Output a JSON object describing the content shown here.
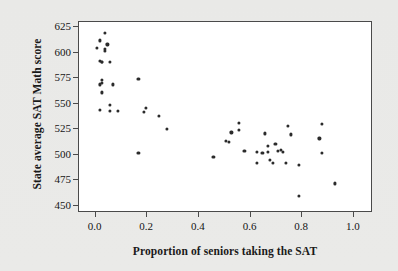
{
  "figure": {
    "background_color": "#e9e9e7",
    "plot_background_color": "#ffffff",
    "frame_color": "#4a4a4a",
    "point_color": "#2b2b2b"
  },
  "chart_data": {
    "type": "scatter",
    "title": "",
    "xlabel": "Proportion of seniors taking the SAT",
    "ylabel": "State average SAT Math score",
    "xlim": [
      -0.06,
      1.07
    ],
    "ylim": [
      444,
      629
    ],
    "grid": false,
    "legend": null,
    "xticks": [
      0.0,
      0.2,
      0.4,
      0.6,
      0.8,
      1.0
    ],
    "xtick_labels": [
      "0.0",
      "0.2",
      "0.4",
      "0.6",
      "0.8",
      "1.0"
    ],
    "yticks": [
      450,
      475,
      500,
      525,
      550,
      575,
      600,
      625
    ],
    "ytick_labels": [
      "450",
      "475",
      "500",
      "525",
      "550",
      "575",
      "600",
      "625"
    ],
    "points": [
      {
        "x": 0.04,
        "y": 618
      },
      {
        "x": 0.02,
        "y": 611
      },
      {
        "x": 0.05,
        "y": 607
      },
      {
        "x": 0.01,
        "y": 604
      },
      {
        "x": 0.04,
        "y": 603
      },
      {
        "x": 0.04,
        "y": 601
      },
      {
        "x": 0.02,
        "y": 591
      },
      {
        "x": 0.03,
        "y": 590
      },
      {
        "x": 0.03,
        "y": 590
      },
      {
        "x": 0.06,
        "y": 590
      },
      {
        "x": 0.03,
        "y": 572
      },
      {
        "x": 0.03,
        "y": 569
      },
      {
        "x": 0.02,
        "y": 568
      },
      {
        "x": 0.07,
        "y": 568
      },
      {
        "x": 0.17,
        "y": 573
      },
      {
        "x": 0.03,
        "y": 560
      },
      {
        "x": 0.06,
        "y": 548
      },
      {
        "x": 0.02,
        "y": 543
      },
      {
        "x": 0.06,
        "y": 542
      },
      {
        "x": 0.09,
        "y": 542
      },
      {
        "x": 0.2,
        "y": 545
      },
      {
        "x": 0.19,
        "y": 541
      },
      {
        "x": 0.25,
        "y": 537
      },
      {
        "x": 0.28,
        "y": 524
      },
      {
        "x": 0.17,
        "y": 501
      },
      {
        "x": 0.46,
        "y": 497
      },
      {
        "x": 0.51,
        "y": 513
      },
      {
        "x": 0.52,
        "y": 512
      },
      {
        "x": 0.53,
        "y": 521
      },
      {
        "x": 0.56,
        "y": 530
      },
      {
        "x": 0.56,
        "y": 523
      },
      {
        "x": 0.58,
        "y": 503
      },
      {
        "x": 0.63,
        "y": 502
      },
      {
        "x": 0.63,
        "y": 491
      },
      {
        "x": 0.65,
        "y": 501
      },
      {
        "x": 0.66,
        "y": 520
      },
      {
        "x": 0.67,
        "y": 508
      },
      {
        "x": 0.67,
        "y": 502
      },
      {
        "x": 0.68,
        "y": 494
      },
      {
        "x": 0.69,
        "y": 491
      },
      {
        "x": 0.7,
        "y": 510
      },
      {
        "x": 0.71,
        "y": 503
      },
      {
        "x": 0.72,
        "y": 504
      },
      {
        "x": 0.73,
        "y": 502
      },
      {
        "x": 0.74,
        "y": 491
      },
      {
        "x": 0.75,
        "y": 527
      },
      {
        "x": 0.76,
        "y": 519
      },
      {
        "x": 0.79,
        "y": 489
      },
      {
        "x": 0.79,
        "y": 459
      },
      {
        "x": 0.87,
        "y": 515
      },
      {
        "x": 0.88,
        "y": 529
      },
      {
        "x": 0.88,
        "y": 501
      },
      {
        "x": 0.93,
        "y": 471
      }
    ]
  }
}
